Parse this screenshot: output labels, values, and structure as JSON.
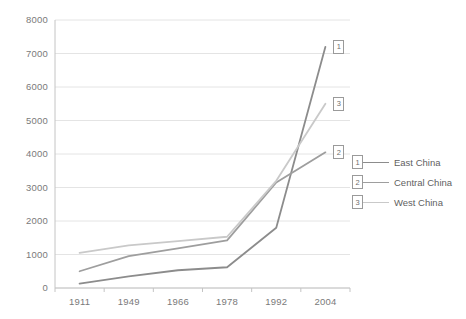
{
  "chart_data": {
    "type": "line",
    "title": "",
    "xlabel": "",
    "ylabel": "",
    "categories": [
      "1911",
      "1949",
      "1966",
      "1978",
      "1992",
      "2004"
    ],
    "ylim": [
      0,
      8000
    ],
    "y_ticks": [
      "0",
      "1000",
      "2000",
      "3000",
      "4000",
      "5000",
      "6000",
      "7000",
      "8000"
    ],
    "grid": true,
    "legend_position": "right",
    "series": [
      {
        "name": "East China",
        "marker_label": "1",
        "color": "#8c8c8c",
        "values": [
          130,
          350,
          530,
          620,
          1800,
          7200
        ]
      },
      {
        "name": "Central China",
        "marker_label": "2",
        "color": "#9e9e9e",
        "values": [
          500,
          950,
          1180,
          1420,
          3150,
          4050
        ]
      },
      {
        "name": "West China",
        "marker_label": "3",
        "color": "#c9c9c9",
        "values": [
          1050,
          1270,
          1400,
          1530,
          3200,
          5500
        ]
      }
    ]
  },
  "legend": {
    "items": [
      {
        "marker": "1",
        "label": "East China"
      },
      {
        "marker": "2",
        "label": "Central China"
      },
      {
        "marker": "3",
        "label": "West China"
      }
    ]
  },
  "axis": {
    "y_labels": [
      "8000",
      "7000",
      "6000",
      "5000",
      "4000",
      "3000",
      "2000",
      "1000",
      "0"
    ],
    "x_labels": [
      "1911",
      "1949",
      "1966",
      "1978",
      "1992",
      "2004"
    ]
  },
  "point_labels": [
    {
      "text": "1"
    },
    {
      "text": "3"
    },
    {
      "text": "2"
    }
  ],
  "colors": {
    "grid": "#e4e4e4",
    "axis": "#c4c4c4",
    "text": "#7a7a7a",
    "series_1": "#8c8c8c",
    "series_2": "#9e9e9e",
    "series_3": "#c9c9c9"
  }
}
